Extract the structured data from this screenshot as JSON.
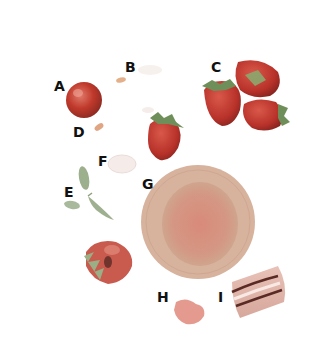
{
  "diagram": {
    "labels": [
      {
        "id": "A",
        "text": "A",
        "x": 54,
        "y": 79
      },
      {
        "id": "B",
        "text": "B",
        "x": 125,
        "y": 60
      },
      {
        "id": "C",
        "text": "C",
        "x": 211,
        "y": 60
      },
      {
        "id": "D",
        "text": "D",
        "x": 73,
        "y": 125
      },
      {
        "id": "E",
        "text": "E",
        "x": 64,
        "y": 185
      },
      {
        "id": "F",
        "text": "F",
        "x": 98,
        "y": 154
      },
      {
        "id": "G",
        "text": "G",
        "x": 142,
        "y": 177
      },
      {
        "id": "H",
        "text": "H",
        "x": 157,
        "y": 290
      },
      {
        "id": "I",
        "text": "I",
        "x": 218,
        "y": 290
      }
    ],
    "objects": [
      {
        "label": "A",
        "name": "red-sphere"
      },
      {
        "label": "B",
        "name": "small-seed"
      },
      {
        "label": "C",
        "name": "strawberry-cluster"
      },
      {
        "label": "D",
        "name": "small-seed"
      },
      {
        "label": "E",
        "name": "green-leaves"
      },
      {
        "label": "F",
        "name": "faint-oval"
      },
      {
        "label": "G",
        "name": "round-disc-cross-section"
      },
      {
        "label": "H",
        "name": "pink-blob"
      },
      {
        "label": "I",
        "name": "striped-slice"
      }
    ],
    "colors": {
      "background": "#ffffff",
      "label_text": "#111111",
      "strawberry_red": "#c0392b",
      "dark_red": "#8e2a22",
      "leaf_green": "#7d9a6a",
      "disc_rim": "#d8b59a",
      "disc_center": "#d98a7a",
      "blob_pink": "#e59a90",
      "stripe_dark": "#5a2a25"
    }
  }
}
